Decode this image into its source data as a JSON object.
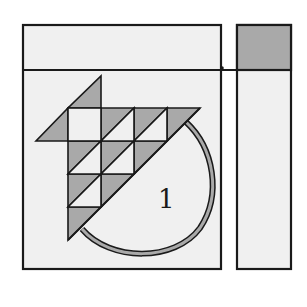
{
  "diagram": {
    "type": "quilt-block-layout",
    "colors": {
      "background": "#ffffff",
      "panel_fill": "#f0f0f0",
      "shaded_fill": "#a9a9a9",
      "stroke": "#1a1a1a",
      "handle_fill": "#a9a9a9"
    },
    "main_block": {
      "label": "1"
    },
    "side_strip": {
      "top_segment": "shaded",
      "bottom_segment": "light"
    }
  }
}
